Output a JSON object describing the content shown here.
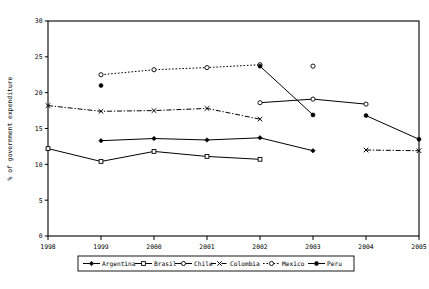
{
  "chart_data": {
    "type": "line",
    "title": "",
    "xlabel": "",
    "ylabel": "% of government expenditure",
    "x": [
      1998,
      1999,
      2000,
      2001,
      2002,
      2003,
      2004,
      2005
    ],
    "xticklabels": [
      "1998",
      "1999",
      "2000",
      "2001",
      "2002",
      "2003",
      "2004",
      "2005"
    ],
    "yticklabels": [
      "0",
      "5",
      "10",
      "15",
      "20",
      "25",
      "30"
    ],
    "yticks": [
      0,
      5,
      10,
      15,
      20,
      25,
      30
    ],
    "ylim": [
      0,
      30
    ],
    "xlim": [
      1998,
      2005
    ],
    "grid": false,
    "legend_position": "bottom",
    "series": [
      {
        "name": "Argentina",
        "marker": "filled-diamond",
        "linestyle": "solid",
        "color": "#000000",
        "points": [
          {
            "x": 1999,
            "y": 13.3
          },
          {
            "x": 2000,
            "y": 13.6
          },
          {
            "x": 2001,
            "y": 13.4
          },
          {
            "x": 2002,
            "y": 13.7
          },
          {
            "x": 2003,
            "y": 11.9
          }
        ]
      },
      {
        "name": "Brasil",
        "marker": "open-square",
        "linestyle": "solid",
        "color": "#000000",
        "points": [
          {
            "x": 1998,
            "y": 12.2
          },
          {
            "x": 1999,
            "y": 10.4
          },
          {
            "x": 2000,
            "y": 11.8
          },
          {
            "x": 2001,
            "y": 11.1
          },
          {
            "x": 2002,
            "y": 10.7
          }
        ]
      },
      {
        "name": "Chile",
        "marker": "open-circle",
        "linestyle": "solid",
        "color": "#000000",
        "points": [
          {
            "x": 2002,
            "y": 18.6
          },
          {
            "x": 2003,
            "y": 19.1
          },
          {
            "x": 2004,
            "y": 18.4
          }
        ]
      },
      {
        "name": "Colombia",
        "marker": "x-mark",
        "linestyle": "dashdot",
        "color": "#000000",
        "points": [
          {
            "x": 1998,
            "y": 18.2
          },
          {
            "x": 1999,
            "y": 17.4
          },
          {
            "x": 2000,
            "y": 17.5
          },
          {
            "x": 2001,
            "y": 17.8
          },
          {
            "x": 2002,
            "y": 16.3
          }
        ],
        "segments2": [
          {
            "x": 2004,
            "y": 12.0
          },
          {
            "x": 2005,
            "y": 11.9
          }
        ]
      },
      {
        "name": "Mexico",
        "marker": "open-circle",
        "linestyle": "dotted",
        "color": "#000000",
        "points": [
          {
            "x": 1999,
            "y": 22.5
          },
          {
            "x": 2000,
            "y": 23.2
          },
          {
            "x": 2001,
            "y": 23.5
          },
          {
            "x": 2002,
            "y": 23.9
          }
        ],
        "isolated": [
          {
            "x": 2003,
            "y": 23.7
          }
        ]
      },
      {
        "name": "Peru",
        "marker": "filled-circle",
        "linestyle": "solid",
        "color": "#000000",
        "points": [
          {
            "x": 2002,
            "y": 23.7
          },
          {
            "x": 2003,
            "y": 16.9
          }
        ],
        "isolated": [
          {
            "x": 1999,
            "y": 21.0
          }
        ],
        "segments2": [
          {
            "x": 2004,
            "y": 16.8
          },
          {
            "x": 2005,
            "y": 13.5
          }
        ]
      }
    ],
    "legend": [
      {
        "label": "Argentina",
        "marker": "filled-diamond",
        "linestyle": "solid"
      },
      {
        "label": "Brasil",
        "marker": "open-square",
        "linestyle": "solid"
      },
      {
        "label": "Chile",
        "marker": "open-circle",
        "linestyle": "solid"
      },
      {
        "label": "Colombia",
        "marker": "x-mark",
        "linestyle": "dashdot"
      },
      {
        "label": "Mexico",
        "marker": "open-circle",
        "linestyle": "dotted"
      },
      {
        "label": "Peru",
        "marker": "filled-circle",
        "linestyle": "solid"
      }
    ]
  }
}
